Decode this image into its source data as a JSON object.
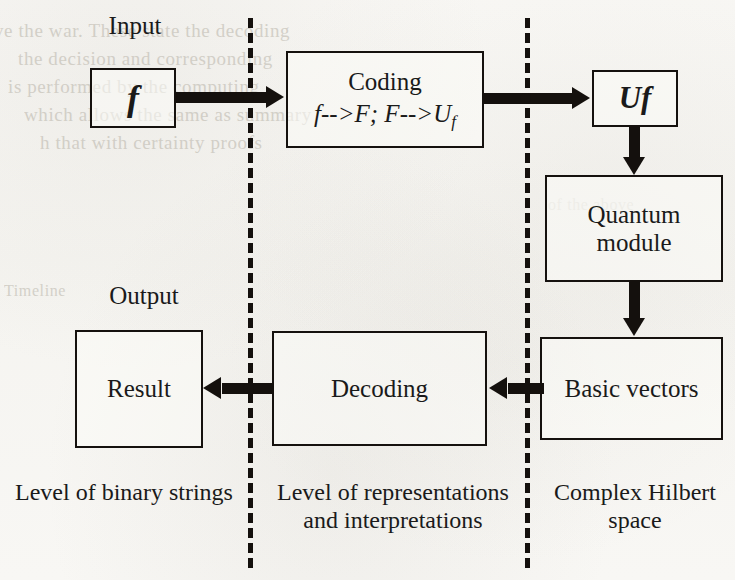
{
  "diagram": {
    "labels": {
      "input": "Input",
      "output": "Output"
    },
    "boxes": {
      "f": {
        "text": "f"
      },
      "coding": {
        "line1": "Coding",
        "line2_a": "f-->F; F-->U",
        "line2_sub": "f"
      },
      "uf": {
        "text": "Uf"
      },
      "quantum_module": {
        "text": "Quantum module"
      },
      "basic_vectors": {
        "text": "Basic vectors"
      },
      "decoding": {
        "text": "Decoding"
      },
      "result": {
        "text": "Result"
      }
    },
    "captions": {
      "left": "Level of binary strings",
      "middle_line1": "Level of",
      "middle_line2": "representations and",
      "middle_line3": "interpretations",
      "right_line1": "Complex Hilbert",
      "right_line2": "space"
    },
    "ghost_text": {
      "g1": "ve the war. These state the decoding",
      "g2": "the decision and corresponding",
      "g3": "is performed by the computing",
      "g4": "which allows the same as summary",
      "g5": "h that with certainty proofs",
      "g6": "Timeline",
      "g7": "of the above"
    },
    "colors": {
      "ink": "#14100d",
      "paper": "#f7f6f3",
      "ghost": "#b6b1a6"
    }
  }
}
